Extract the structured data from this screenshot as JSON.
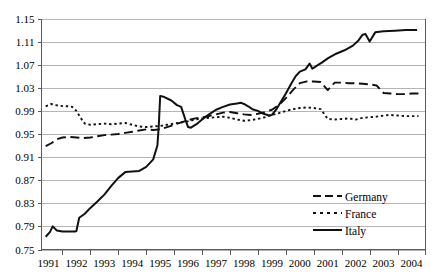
{
  "chart_data": {
    "type": "line",
    "title": "",
    "subtitle": "",
    "xlabel": "",
    "ylabel": "",
    "grid": "horizontal",
    "legend_position": "bottom-right",
    "xlim": [
      1990.75,
      2004.5
    ],
    "ylim": [
      0.75,
      1.15
    ],
    "ytick_labels": [
      "1.15",
      "1.11",
      "1.07",
      "1.03",
      "0.99",
      "0.95",
      "0.91",
      "0.87",
      "0.83",
      "0.79",
      "0.75"
    ],
    "ytick_values": [
      1.15,
      1.11,
      1.07,
      1.03,
      0.99,
      0.95,
      0.91,
      0.87,
      0.83,
      0.79,
      0.75
    ],
    "xtick_labels": [
      "1991",
      "1992",
      "1993",
      "1994",
      "1995",
      "1996",
      "1997",
      "1998",
      "1999",
      "2000",
      "2001",
      "2002",
      "2003",
      "2004"
    ],
    "xtick_values": [
      1991,
      1992,
      1993,
      1994,
      1995,
      1996,
      1997,
      1998,
      1999,
      2000,
      2001,
      2002,
      2003,
      2004
    ],
    "series": [
      {
        "name": "Germany",
        "dash": "long-dash",
        "color": "#111111",
        "width": 1.9,
        "x": [
          1990.9,
          1991.1,
          1991.3,
          1991.5,
          1991.75,
          1992.0,
          1992.25,
          1992.5,
          1992.75,
          1993.0,
          1993.25,
          1993.5,
          1993.75,
          1994.0,
          1994.25,
          1994.5,
          1994.75,
          1995.0,
          1995.25,
          1995.5,
          1995.75,
          1996.0,
          1996.25,
          1996.5,
          1996.75,
          1997.0,
          1997.25,
          1997.5,
          1997.75,
          1998.0,
          1998.25,
          1998.5,
          1998.75,
          1999.0,
          1999.25,
          1999.5,
          1999.75,
          2000.0,
          2000.25,
          2000.5,
          2000.75,
          2001.0,
          2001.25,
          2001.5,
          2001.75,
          2002.0,
          2002.25,
          2002.5,
          2002.75,
          2003.0,
          2003.25,
          2003.5,
          2003.75,
          2004.0,
          2004.25
        ],
        "values": [
          0.929,
          0.934,
          0.941,
          0.944,
          0.945,
          0.944,
          0.943,
          0.944,
          0.946,
          0.948,
          0.949,
          0.95,
          0.952,
          0.954,
          0.956,
          0.958,
          0.957,
          0.958,
          0.962,
          0.966,
          0.97,
          0.974,
          0.977,
          0.979,
          0.981,
          0.984,
          0.987,
          0.988,
          0.986,
          0.984,
          0.983,
          0.985,
          0.988,
          0.992,
          1.0,
          1.012,
          1.026,
          1.038,
          1.041,
          1.041,
          1.04,
          1.026,
          1.039,
          1.039,
          1.038,
          1.038,
          1.037,
          1.036,
          1.034,
          1.021,
          1.02,
          1.019,
          1.019,
          1.02,
          1.02
        ]
      },
      {
        "name": "France",
        "dash": "dotted",
        "color": "#111111",
        "width": 1.9,
        "x": [
          1990.9,
          1991.1,
          1991.25,
          1991.4,
          1991.55,
          1991.7,
          1991.85,
          1992.0,
          1992.15,
          1992.3,
          1992.5,
          1992.75,
          1993.0,
          1993.25,
          1993.5,
          1993.75,
          1994.0,
          1994.25,
          1994.5,
          1994.75,
          1995.0,
          1995.25,
          1995.5,
          1995.75,
          1996.0,
          1996.25,
          1996.5,
          1996.75,
          1997.0,
          1997.25,
          1997.5,
          1997.75,
          1998.0,
          1998.25,
          1998.5,
          1998.75,
          1999.0,
          1999.25,
          1999.5,
          1999.75,
          2000.0,
          2000.25,
          2000.5,
          2000.75,
          2001.0,
          2001.25,
          2001.5,
          2001.75,
          2002.0,
          2002.25,
          2002.5,
          2002.75,
          2003.0,
          2003.25,
          2003.5,
          2003.75,
          2004.0,
          2004.25
        ],
        "values": [
          0.998,
          1.002,
          1.0,
          0.999,
          0.998,
          0.998,
          0.997,
          0.99,
          0.978,
          0.968,
          0.966,
          0.967,
          0.968,
          0.967,
          0.968,
          0.969,
          0.966,
          0.963,
          0.962,
          0.963,
          0.964,
          0.966,
          0.968,
          0.97,
          0.972,
          0.975,
          0.977,
          0.978,
          0.979,
          0.98,
          0.978,
          0.975,
          0.973,
          0.974,
          0.976,
          0.979,
          0.983,
          0.986,
          0.99,
          0.993,
          0.995,
          0.996,
          0.995,
          0.993,
          0.976,
          0.975,
          0.976,
          0.977,
          0.975,
          0.978,
          0.979,
          0.98,
          0.982,
          0.983,
          0.982,
          0.981,
          0.981,
          0.981
        ]
      },
      {
        "name": "Italy",
        "dash": "solid",
        "color": "#111111",
        "width": 2.0,
        "x": [
          1990.9,
          1991.05,
          1991.15,
          1991.3,
          1991.5,
          1991.75,
          1991.95,
          1992.0,
          1992.1,
          1992.3,
          1992.5,
          1992.75,
          1993.0,
          1993.25,
          1993.5,
          1993.75,
          1994.0,
          1994.25,
          1994.5,
          1994.75,
          1994.9,
          1994.95,
          1995.0,
          1995.15,
          1995.4,
          1995.6,
          1995.75,
          1995.9,
          1996.0,
          1996.1,
          1996.3,
          1996.5,
          1996.75,
          1997.0,
          1997.25,
          1997.5,
          1997.75,
          1997.9,
          1998.0,
          1998.15,
          1998.3,
          1998.5,
          1998.7,
          1998.9,
          1999.0,
          1999.15,
          1999.3,
          1999.5,
          1999.7,
          1999.85,
          2000.0,
          2000.2,
          2000.35,
          2000.45,
          2000.6,
          2000.8,
          2001.0,
          2001.3,
          2001.6,
          2001.9,
          2002.1,
          2002.25,
          2002.35,
          2002.5,
          2002.7,
          2003.0,
          2003.4,
          2003.8,
          2004.2
        ],
        "values": [
          0.772,
          0.78,
          0.79,
          0.783,
          0.781,
          0.781,
          0.781,
          0.782,
          0.805,
          0.812,
          0.822,
          0.833,
          0.845,
          0.86,
          0.874,
          0.884,
          0.885,
          0.886,
          0.893,
          0.906,
          0.93,
          0.965,
          1.016,
          1.014,
          1.008,
          1.0,
          0.997,
          0.975,
          0.962,
          0.961,
          0.967,
          0.975,
          0.984,
          0.992,
          0.997,
          1.001,
          1.003,
          1.004,
          1.002,
          0.998,
          0.993,
          0.99,
          0.985,
          0.982,
          0.983,
          0.992,
          1.004,
          1.02,
          1.038,
          1.05,
          1.058,
          1.062,
          1.072,
          1.063,
          1.068,
          1.074,
          1.081,
          1.089,
          1.095,
          1.103,
          1.112,
          1.122,
          1.123,
          1.11,
          1.126,
          1.128,
          1.129,
          1.13,
          1.13
        ]
      }
    ]
  },
  "legend": {
    "items": [
      {
        "label": "Germany",
        "marker": "long-dash-marker"
      },
      {
        "label": "France",
        "marker": "dotted-marker"
      },
      {
        "label": "Italy",
        "marker": "solid-marker"
      }
    ]
  }
}
